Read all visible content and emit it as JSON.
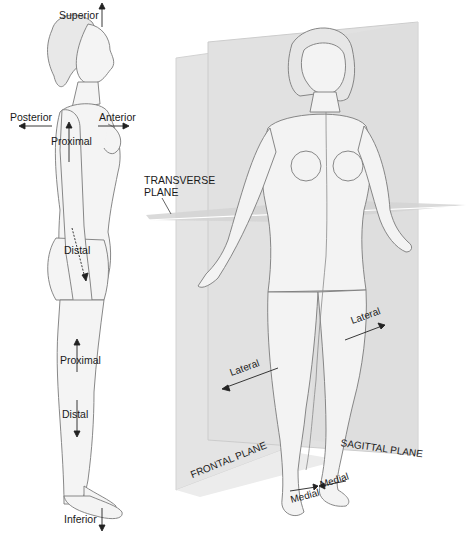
{
  "figure": {
    "side_view": {
      "labels": {
        "superior": "Superior",
        "inferior": "Inferior",
        "posterior": "Posterior",
        "anterior": "Anterior",
        "proximal_arm": "Proximal",
        "distal_arm": "Distal",
        "proximal_leg": "Proximal",
        "distal_leg": "Distal"
      }
    },
    "front_view": {
      "labels": {
        "transverse_plane": "TRANSVERSE",
        "transverse_plane_2": "PLANE",
        "lateral_right": "Lateral",
        "lateral_left": "Lateral",
        "frontal_plane": "FRONTAL PLANE",
        "sagittal_plane": "SAGITTAL PLANE",
        "medial_left": "Medial",
        "medial_right": "Medial"
      }
    },
    "colors": {
      "plane_fill": "#e6e6e6",
      "plane_edge": "#cfcfcf",
      "body_fill": "#f4f4f4",
      "body_line": "#6e6e6e",
      "text": "#1a1a1a"
    }
  }
}
